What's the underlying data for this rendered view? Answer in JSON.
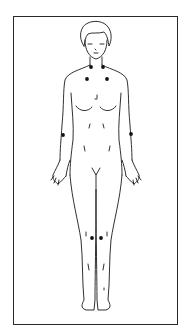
{
  "diagram": {
    "marker_color": "#111111",
    "line_color": "#1a1a1a",
    "markers": [
      {
        "id": "neck-left",
        "x": 91,
        "y": 67
      },
      {
        "id": "neck-right",
        "x": 103,
        "y": 67
      },
      {
        "id": "upper-chest-left",
        "x": 87,
        "y": 79
      },
      {
        "id": "upper-chest-right",
        "x": 107,
        "y": 79
      },
      {
        "id": "elbow-left",
        "x": 63,
        "y": 135
      },
      {
        "id": "elbow-right",
        "x": 131,
        "y": 134
      },
      {
        "id": "knee-left",
        "x": 92,
        "y": 238
      },
      {
        "id": "knee-right",
        "x": 101,
        "y": 238
      }
    ]
  }
}
